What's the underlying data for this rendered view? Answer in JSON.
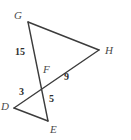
{
  "figure": {
    "background_color": "#ffffff",
    "stroke_color": "#3c3c3c",
    "label_color": "#4a4a4a",
    "length_color": "#2e2e2e",
    "width": 131,
    "height": 140
  },
  "vertices": [
    {
      "id": "G",
      "label": "G",
      "x": 28,
      "y": 22,
      "label_x": 14,
      "label_y": 10
    },
    {
      "id": "H",
      "label": "H",
      "x": 99,
      "y": 50,
      "label_x": 105,
      "label_y": 45
    },
    {
      "id": "F",
      "label": "F",
      "x": 41,
      "y": 86,
      "label_x": 43,
      "label_y": 64
    },
    {
      "id": "D",
      "label": "D",
      "x": 14,
      "y": 108,
      "label_x": 1,
      "label_y": 101
    },
    {
      "id": "E",
      "label": "E",
      "x": 48,
      "y": 121,
      "label_x": 50,
      "label_y": 124
    }
  ],
  "segments": [
    {
      "id": "GH",
      "from": "G",
      "to": "H"
    },
    {
      "id": "GE",
      "from": "G",
      "to": "E"
    },
    {
      "id": "HD",
      "from": "H",
      "to": "D"
    },
    {
      "id": "DE",
      "from": "D",
      "to": "E"
    }
  ],
  "length_labels": [
    {
      "id": "GF",
      "value": "15",
      "x": 15,
      "y": 47
    },
    {
      "id": "FH",
      "value": "9",
      "x": 64,
      "y": 72
    },
    {
      "id": "DF",
      "value": "3",
      "x": 19,
      "y": 87
    },
    {
      "id": "FE",
      "value": "5",
      "x": 49,
      "y": 94
    }
  ]
}
